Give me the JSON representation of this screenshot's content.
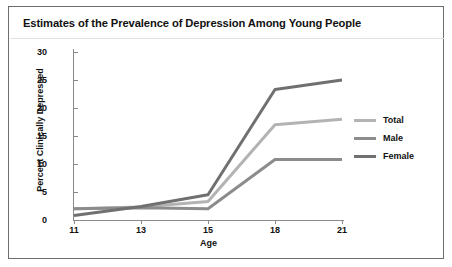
{
  "figure": {
    "title": "Estimates of the Prevalence of Depression Among Young People",
    "border_color": "#6d6d6d",
    "background": "#ffffff"
  },
  "chart_data": {
    "type": "line",
    "title": "Estimates of the Prevalence of Depression Among Young People",
    "xlabel": "Age",
    "ylabel": "Percent Clinically Depressed",
    "categories": [
      "11",
      "13",
      "15",
      "18",
      "21"
    ],
    "xticklabels": [
      "11",
      "13",
      "15",
      "18",
      "21"
    ],
    "yticklabels": [
      "0",
      "5",
      "10",
      "15",
      "20",
      "25",
      "30"
    ],
    "yticks": [
      0,
      5,
      10,
      15,
      20,
      25,
      30
    ],
    "ylim": [
      0,
      30
    ],
    "grid": false,
    "legend_position": "right",
    "series": [
      {
        "name": "Total",
        "color": "#b3b3b3",
        "values": [
          2.0,
          2.3,
          3.3,
          17.0,
          18.0
        ]
      },
      {
        "name": "Male",
        "color": "#8c8c8c",
        "values": [
          2.0,
          2.2,
          2.0,
          10.8,
          10.8
        ]
      },
      {
        "name": "Female",
        "color": "#707070",
        "values": [
          0.8,
          2.4,
          4.5,
          23.3,
          25.0
        ]
      }
    ]
  },
  "legend": {
    "items": [
      {
        "label": "Total",
        "color": "#b3b3b3"
      },
      {
        "label": "Male",
        "color": "#8c8c8c"
      },
      {
        "label": "Female",
        "color": "#707070"
      }
    ]
  }
}
